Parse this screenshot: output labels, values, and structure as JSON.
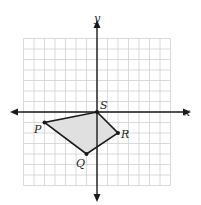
{
  "diagram": {
    "type": "coordinate-plane",
    "axes": {
      "x_label": "x",
      "y_label": "y"
    },
    "grid": {
      "min": -7,
      "max": 7,
      "step": 1
    },
    "colors": {
      "grid": "#d0d0d0",
      "axis": "#1a1a1a",
      "fill": "#e0e0e0",
      "edge": "#1a1a1a"
    },
    "polygon": {
      "points": [
        {
          "name": "S",
          "x": 0,
          "y": 0
        },
        {
          "name": "R",
          "x": 2,
          "y": -2
        },
        {
          "name": "Q",
          "x": -1,
          "y": -4
        },
        {
          "name": "P",
          "x": -5,
          "y": -1
        }
      ]
    }
  }
}
